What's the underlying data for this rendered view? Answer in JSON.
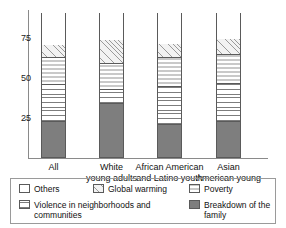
{
  "chart_data": {
    "type": "bar",
    "subtype": "stacked-bar",
    "title": "",
    "xlabel": "",
    "ylabel": "",
    "ylim": [
      0,
      100
    ],
    "yticks": [
      25,
      50,
      75
    ],
    "ytick_labels": [
      "25",
      "50",
      "75"
    ],
    "grid": false,
    "legend_position": "bottom",
    "categories": [
      "All",
      "White\nyoung adults",
      "African American\nand Latino youth",
      "Asian\nAmerican young"
    ],
    "series": [
      {
        "name": "Breakdown of the family",
        "values": [
          23,
          34,
          21,
          23
        ]
      },
      {
        "name": "Violence in neighborhoods and communities",
        "values": [
          23,
          9,
          24,
          24
        ]
      },
      {
        "name": "Poverty",
        "values": [
          17,
          16,
          18,
          18
        ]
      },
      {
        "name": "Global warming",
        "values": [
          8,
          15,
          9,
          10
        ]
      },
      {
        "name": "Others",
        "values": [
          20,
          18,
          20,
          17
        ]
      }
    ],
    "cumulative_tops": [
      [
        23,
        46,
        63,
        71,
        91
      ],
      [
        34,
        43,
        59,
        74,
        91
      ],
      [
        21,
        45,
        63,
        72,
        91
      ],
      [
        23,
        47,
        65,
        75,
        91
      ]
    ]
  },
  "axis": {
    "ticks": [
      {
        "label": "75",
        "value": 75
      },
      {
        "label": "50",
        "value": 50
      },
      {
        "label": "25",
        "value": 25
      }
    ]
  },
  "legend": {
    "items": [
      {
        "label": "Others",
        "pattern": "fill-others"
      },
      {
        "label": "Global warming",
        "pattern": "fill-global"
      },
      {
        "label": "Poverty",
        "pattern": "fill-poverty"
      },
      {
        "label": "Violence in neighborhoods and\ncommunities",
        "pattern": "fill-violence"
      },
      {
        "label": "Breakdown of the family",
        "pattern": "fill-breakdown"
      }
    ]
  }
}
